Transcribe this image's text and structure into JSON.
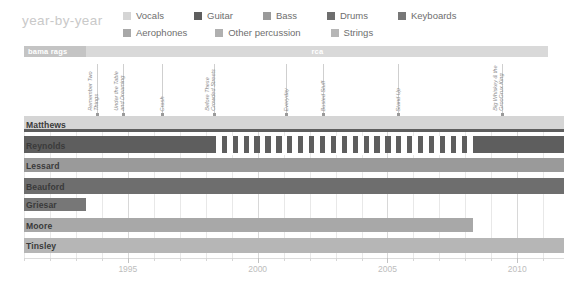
{
  "header": {
    "title": "year-by-year",
    "legend": {
      "row1": [
        {
          "label": "Vocals",
          "color": "#d5d5d5"
        },
        {
          "label": "Guitar",
          "color": "#5e5e5e"
        },
        {
          "label": "Bass",
          "color": "#9a9a9a"
        },
        {
          "label": "Drums",
          "color": "#6e6e6e"
        },
        {
          "label": "Keyboards",
          "color": "#777777"
        }
      ],
      "row2": [
        {
          "label": "Aerophones",
          "color": "#a8a8a8"
        },
        {
          "label": "Other percussion",
          "color": "#b0b0b0"
        },
        {
          "label": "Strings",
          "color": "#b6b6b6"
        }
      ]
    }
  },
  "labelbar": {
    "segments": [
      {
        "label": "bama rags",
        "start": 1991.0,
        "end": 1993.4,
        "color": "#c4c4c4",
        "align": "left"
      },
      {
        "label": "rca",
        "start": 1993.4,
        "end": 2011.2,
        "color": "#d9d9d9",
        "align": "center"
      }
    ]
  },
  "albums": [
    {
      "label": "Remember Two Things",
      "year": 1993.8
    },
    {
      "label": "Under the Table and Dreaming",
      "year": 1994.8
    },
    {
      "label": "Crash",
      "year": 1996.3
    },
    {
      "label": "Before These Crowded Streets",
      "year": 1998.3
    },
    {
      "label": "Everyday",
      "year": 2001.1
    },
    {
      "label": "Busted Stuff",
      "year": 2002.5
    },
    {
      "label": "Stand Up",
      "year": 2005.4
    },
    {
      "label": "Big Whiskey & the GrooGrux King",
      "year": 2009.4
    }
  ],
  "chart_data": {
    "type": "bar",
    "title": "year-by-year",
    "xlabel": "",
    "ylabel": "",
    "xlim": [
      1991.0,
      2011.8
    ],
    "grid": true,
    "legend_position": "top",
    "categories": [
      "Matthews",
      "Reynolds",
      "Lessard",
      "Beauford",
      "Griesar",
      "Moore",
      "Tinsley"
    ],
    "tick_values": [
      1995,
      2000,
      2005,
      2010
    ],
    "tick_labels": [
      "1995",
      "2000",
      "2005",
      "2010"
    ],
    "minor_tick_step": 1,
    "rows": [
      {
        "name": "Matthews",
        "bars": [
          {
            "role": "Vocals",
            "color": "#d5d5d5",
            "start": 1991.0,
            "end": 2011.8,
            "top": 0,
            "height": 13
          },
          {
            "role": "Guitar",
            "color": "#5e5e5e",
            "start": 1991.0,
            "end": 2011.8,
            "top": 13,
            "height": 3
          }
        ]
      },
      {
        "name": "Reynolds",
        "bars": [
          {
            "role": "Guitar",
            "color": "#5e5e5e",
            "start": 1991.0,
            "end": 2011.8,
            "top": 0,
            "height": 17
          }
        ],
        "gap": {
          "start": 1998.4,
          "end": 2008.1,
          "period": 0.42,
          "duty": 0.52
        }
      },
      {
        "name": "Lessard",
        "bars": [
          {
            "role": "Bass",
            "color": "#9a9a9a",
            "start": 1991.0,
            "end": 2011.8,
            "top": 0,
            "height": 14
          }
        ]
      },
      {
        "name": "Beauford",
        "bars": [
          {
            "role": "Drums",
            "color": "#6e6e6e",
            "start": 1991.0,
            "end": 2011.8,
            "top": 0,
            "height": 16
          }
        ]
      },
      {
        "name": "Griesar",
        "bars": [
          {
            "role": "Keyboards",
            "color": "#777777",
            "start": 1991.0,
            "end": 1993.4,
            "top": 0,
            "height": 13
          }
        ]
      },
      {
        "name": "Moore",
        "bars": [
          {
            "role": "Aerophones",
            "color": "#a8a8a8",
            "start": 1991.0,
            "end": 2008.3,
            "top": 0,
            "height": 14
          }
        ]
      },
      {
        "name": "Tinsley",
        "bars": [
          {
            "role": "Strings",
            "color": "#b6b6b6",
            "start": 1991.0,
            "end": 2011.8,
            "top": 0,
            "height": 15
          }
        ]
      }
    ]
  }
}
